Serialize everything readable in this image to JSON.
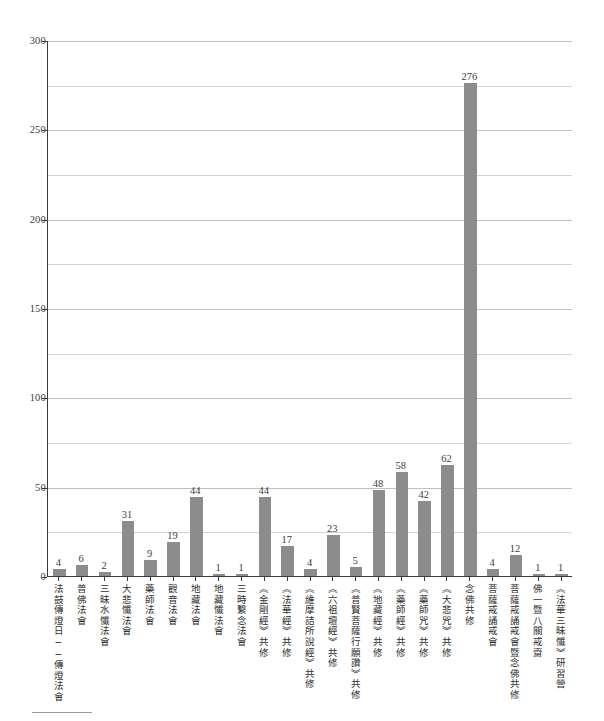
{
  "chart_data": {
    "type": "bar",
    "title": "",
    "xlabel": "",
    "ylabel": "",
    "ylim": [
      0,
      300
    ],
    "yticks": [
      0,
      50,
      100,
      150,
      200,
      250,
      300
    ],
    "minor_gridline_step": 25,
    "grid": true,
    "legend": "none",
    "bar_color": "#8c8c8c",
    "categories": [
      "法鼓傳燈日──傳燈法會",
      "普佛法會",
      "三昧水懺法會",
      "大悲懺法會",
      "藥師法會",
      "觀音法會",
      "地藏法會",
      "地藏懺法會",
      "三時繫念法會",
      "《金剛經》共修",
      "《法華經》共修",
      "《維摩詰所說經》共修",
      "《六祖壇經》共修",
      "《普賢菩薩行願讚》共修",
      "《地藏經》共修",
      "《藥師經》共修",
      "《藥師咒》共修",
      "《大悲咒》共修",
      "念佛共修",
      "菩薩戒誦戒會",
      "菩薩戒誦戒會暨念佛共修",
      "佛一暨八關戒齋",
      "《法華三昧懺》研習營"
    ],
    "values": [
      4,
      6,
      2,
      31,
      9,
      19,
      44,
      1,
      1,
      44,
      17,
      4,
      23,
      5,
      48,
      58,
      42,
      62,
      276,
      4,
      12,
      1,
      1
    ]
  }
}
